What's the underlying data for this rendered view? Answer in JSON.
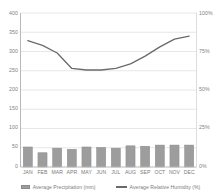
{
  "chart_data": {
    "type": "bar",
    "title": "",
    "subtitle": "",
    "xlabel": "",
    "ylabel": "",
    "categories": [
      "JAN",
      "FEB",
      "MAR",
      "APR",
      "MAY",
      "JUN",
      "JUL",
      "AUG",
      "SEP",
      "OCT",
      "NOV",
      "DEC"
    ],
    "series": [
      {
        "name": "Average Precipitation (mm)",
        "type": "bar",
        "axis": "left",
        "unit": "mm",
        "color": "#9d9d9d",
        "values": [
          52,
          37,
          49,
          46,
          52,
          51,
          49,
          55,
          54,
          57,
          57,
          57
        ]
      },
      {
        "name": "Average Relative Humidity (%)",
        "type": "line",
        "axis": "right",
        "unit": "%",
        "color": "#6a6a6a",
        "values": [
          82,
          79,
          74,
          64,
          63,
          63,
          64,
          67,
          72,
          78,
          83,
          85
        ]
      }
    ],
    "left_axis": {
      "ticks": [
        "0",
        "50",
        "100",
        "150",
        "200",
        "250",
        "300",
        "350",
        "400"
      ],
      "min": 0,
      "max": 400,
      "unit": "mm"
    },
    "right_axis": {
      "ticks": [
        "0%",
        "25%",
        "50%",
        "75%",
        "100%"
      ],
      "min": 0,
      "max": 100,
      "unit": "%"
    },
    "grid": true,
    "legend_position": "bottom"
  },
  "legend": {
    "items": [
      {
        "label": "Average Precipitation (mm)",
        "marker": "bar-swatch"
      },
      {
        "label": "Average Relative Humidity (%)",
        "marker": "line-swatch"
      }
    ]
  }
}
